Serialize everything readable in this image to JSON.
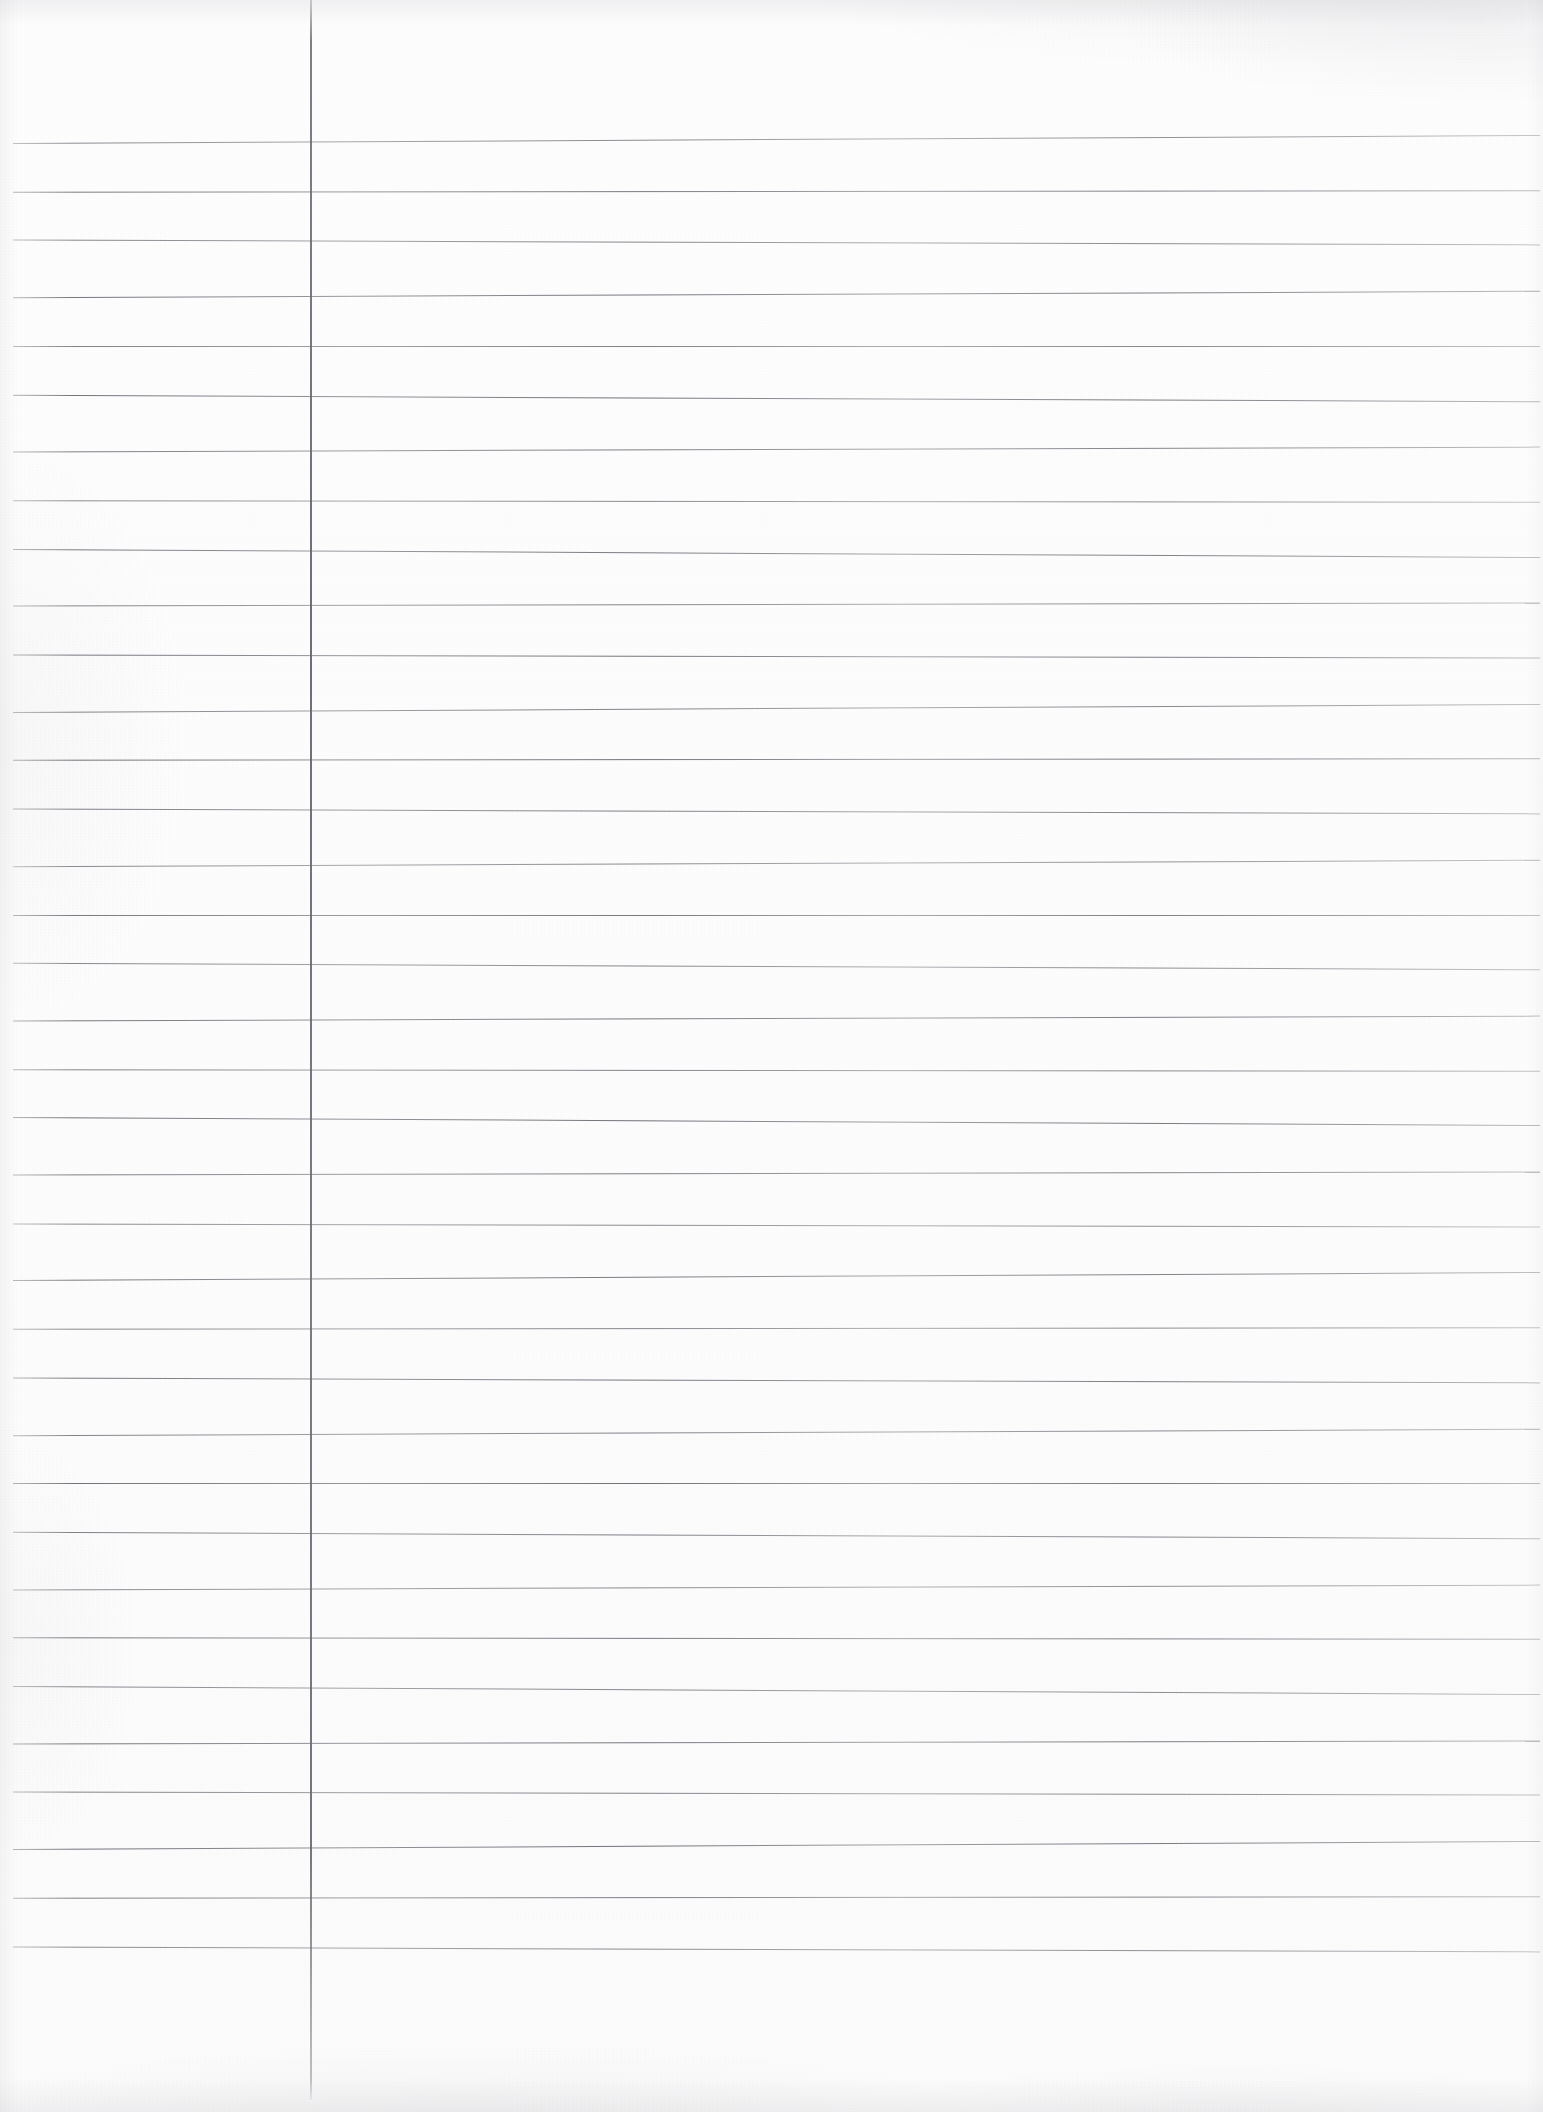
{
  "document": {
    "kind": "lined-notebook-paper-scan",
    "title": "",
    "written_text": "",
    "is_blank": true,
    "page_number": "",
    "width_px": 1543,
    "height_px": 2112
  },
  "colors": {
    "paper_background": "#fdfdfd",
    "rule_line": "#6a6a72",
    "margin_line": "#6e6e76",
    "scan_shadow": "#82828a"
  },
  "ruling": {
    "style": "wide-ruled-single-margin",
    "line_count": 36,
    "first_line_y": 139,
    "line_spacing": 51.7,
    "line_start_x": 13,
    "line_end_x": 1540,
    "line_thickness": 1
  },
  "margin_rule": {
    "orientation": "vertical",
    "x": 310,
    "top_y": 0,
    "bottom_y": 2100,
    "thickness": 2
  },
  "regions": {
    "left_margin_label": "left-margin",
    "body_label": "writing-body",
    "header_label": "header-area",
    "footer_label": "footer-area"
  }
}
